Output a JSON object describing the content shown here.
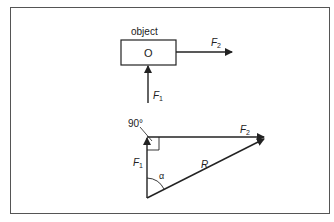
{
  "diagram": {
    "top": {
      "object_label": "object",
      "box_label": "O",
      "force_right": {
        "symbol": "F",
        "sub": "2"
      },
      "force_up": {
        "symbol": "F",
        "sub": "1"
      }
    },
    "triangle": {
      "angle_label": "90°",
      "f1": {
        "symbol": "F",
        "sub": "1"
      },
      "f2": {
        "symbol": "F",
        "sub": "2"
      },
      "resultant": "R",
      "alpha": "α"
    },
    "colors": {
      "ink": "#222222",
      "frame": "#555555"
    }
  }
}
